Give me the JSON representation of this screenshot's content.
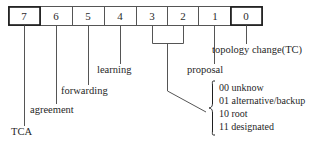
{
  "diagram": {
    "bit_row": {
      "cells": [
        {
          "label": "7",
          "emphasis": "bold-border"
        },
        {
          "label": "6",
          "emphasis": "normal"
        },
        {
          "label": "5",
          "emphasis": "normal"
        },
        {
          "label": "4",
          "emphasis": "normal"
        },
        {
          "label": "3",
          "emphasis": "normal"
        },
        {
          "label": "2",
          "emphasis": "normal"
        },
        {
          "label": "1",
          "emphasis": "normal"
        },
        {
          "label": "0",
          "emphasis": "bold-border"
        }
      ]
    },
    "annotations": [
      {
        "bit": "7",
        "label": "TCA"
      },
      {
        "bit": "6",
        "label": "agreement"
      },
      {
        "bit": "5",
        "label": "forwarding"
      },
      {
        "bit": "4",
        "label": "learning"
      },
      {
        "bit": "1",
        "label": "proposal"
      },
      {
        "bit": "0",
        "label": "topology change(TC)"
      }
    ],
    "grouped_bits": {
      "bits": "3,2",
      "values": [
        {
          "code": "00",
          "meaning": "unknow"
        },
        {
          "code": "01",
          "meaning": "alternative/backup"
        },
        {
          "code": "10",
          "meaning": "root"
        },
        {
          "code": "11",
          "meaning": "designated"
        }
      ]
    },
    "colors": {
      "stroke": "#555555",
      "stroke_bold": "#1a1a1a",
      "background": "#ffffff",
      "text": "#1f1f1f"
    }
  }
}
